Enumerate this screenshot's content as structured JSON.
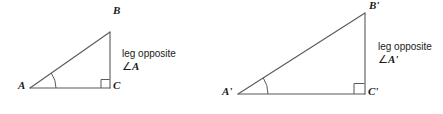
{
  "figure": {
    "background_color": "#ffffff",
    "stroke_color": "#59595b",
    "text_color": "#1a1a1a"
  },
  "triangles": [
    {
      "id": "triangle-abc",
      "name": "triangle-abc",
      "vertices": [
        {
          "label": "A",
          "x": 30,
          "y": 88,
          "label_x": 18,
          "label_y": 83,
          "marker": "angle-arc"
        },
        {
          "label": "B",
          "x": 110,
          "y": 32,
          "label_x": 113,
          "label_y": 8,
          "marker": "none"
        },
        {
          "label": "C",
          "x": 110,
          "y": 88,
          "label_x": 113,
          "label_y": 83,
          "marker": "right-angle"
        }
      ],
      "edges": [
        {
          "name": "hypotenuse-ab",
          "from": "A",
          "to": "B"
        },
        {
          "name": "leg-bc",
          "from": "B",
          "to": "C"
        },
        {
          "name": "leg-ac",
          "from": "A",
          "to": "C"
        }
      ],
      "angle_arc": {
        "cx": 30,
        "cy": 88,
        "radius": 26,
        "start_deg": 0,
        "end_deg": 35
      },
      "right_angle_square": {
        "x": 101,
        "y": 79,
        "size": 8
      },
      "callout": {
        "line1": "leg opposite",
        "angle_symbol": "∠",
        "angle_name": "A",
        "x": 122,
        "y": 54
      }
    },
    {
      "id": "triangle-abc-prime",
      "name": "triangle-a-prime-b-prime-c-prime",
      "vertices": [
        {
          "label": "A'",
          "x": 238,
          "y": 94,
          "label_x": 224,
          "label_y": 89,
          "marker": "angle-arc"
        },
        {
          "label": "B'",
          "x": 365,
          "y": 13,
          "label_x": 369,
          "label_y": 2,
          "marker": "none"
        },
        {
          "label": "C'",
          "x": 365,
          "y": 94,
          "label_x": 368,
          "label_y": 89,
          "marker": "right-angle"
        }
      ],
      "edges": [
        {
          "name": "hypotenuse-a-prime-b-prime",
          "from": "A'",
          "to": "B'"
        },
        {
          "name": "leg-b-prime-c-prime",
          "from": "B'",
          "to": "C'"
        },
        {
          "name": "leg-a-prime-c-prime",
          "from": "A'",
          "to": "C'"
        }
      ],
      "angle_arc": {
        "cx": 238,
        "cy": 94,
        "radius": 30,
        "start_deg": 0,
        "end_deg": 32.5
      },
      "right_angle_square": {
        "x": 355,
        "y": 84,
        "size": 10
      },
      "callout": {
        "line1": "leg opposite",
        "angle_symbol": "∠",
        "angle_name": "A'",
        "x": 378,
        "y": 47
      }
    }
  ]
}
